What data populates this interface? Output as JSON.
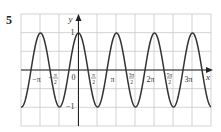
{
  "question_number": "5",
  "chart_data": {
    "type": "line",
    "title": "",
    "function": "y = cos(2x)",
    "xlabel": "x",
    "ylabel": "y",
    "xlim": [
      -4.712,
      10.996
    ],
    "ylim": [
      -1.5,
      1.5
    ],
    "grid": true,
    "x_ticks": [
      {
        "value": -3.1416,
        "label": "−π"
      },
      {
        "value": -1.5708,
        "label": "−π/2"
      },
      {
        "value": 0,
        "label": "0"
      },
      {
        "value": 1.5708,
        "label": "π/2"
      },
      {
        "value": 3.1416,
        "label": "π"
      },
      {
        "value": 4.7124,
        "label": "3π/2"
      },
      {
        "value": 6.2832,
        "label": "2π"
      },
      {
        "value": 7.854,
        "label": "5π/2"
      },
      {
        "value": 9.4248,
        "label": "3π"
      }
    ],
    "y_ticks": [
      {
        "value": 1,
        "label": "1"
      },
      {
        "value": -1,
        "label": "−1"
      }
    ],
    "series": [
      {
        "name": "cos(2x)",
        "color": "#333333",
        "x": [
          -4.712,
          -3.927,
          -3.142,
          -2.356,
          -1.571,
          -0.785,
          0,
          0.785,
          1.571,
          2.356,
          3.142,
          3.927,
          4.712,
          5.498,
          6.283,
          7.069,
          7.854,
          8.639,
          9.425,
          10.21,
          10.996
        ],
        "values": [
          -1,
          0,
          1,
          0,
          -1,
          0,
          1,
          0,
          -1,
          0,
          1,
          0,
          -1,
          0,
          1,
          0,
          -1,
          0,
          1,
          0,
          -1
        ]
      }
    ]
  },
  "colors": {
    "grid": "#c8c8c8",
    "axis": "#222222",
    "curve": "#333333"
  }
}
